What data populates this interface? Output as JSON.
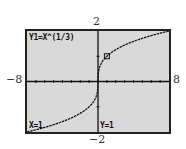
{
  "window": {
    "xmin_label": "−8",
    "xmax_label": "8",
    "ymax_label": "2",
    "ymin_label": "−2",
    "xmin": -8,
    "xmax": 8,
    "ymin": -2,
    "ymax": 2,
    "xscl": 1,
    "yscl": 1
  },
  "screen": {
    "equation": "Y1=X^(1/3)",
    "trace_x": "X=1",
    "trace_y": "Y=1",
    "background": "#d9d9d9",
    "curve_color": "#111111"
  },
  "chart_data": {
    "type": "line",
    "title": "Y1=X^(1/3)",
    "function": "y = x^(1/3)",
    "xlim": [
      -8,
      8
    ],
    "ylim": [
      -2,
      2
    ],
    "x": [
      -6,
      -4,
      -2,
      -1,
      -0.5,
      -0.1,
      0,
      0.1,
      0.5,
      1,
      2,
      4,
      6,
      8
    ],
    "values": [
      -1.817,
      -1.587,
      -1.26,
      -1,
      -0.794,
      -0.464,
      0,
      0.464,
      0.794,
      1,
      1.26,
      1.587,
      1.817,
      2
    ],
    "trace_point": {
      "x": 1,
      "y": 1
    },
    "grid": false
  }
}
